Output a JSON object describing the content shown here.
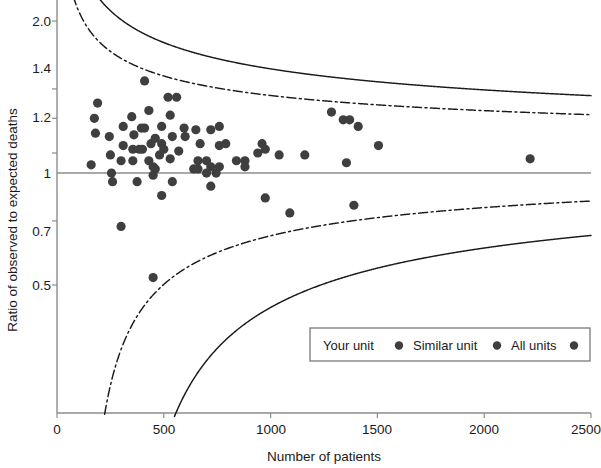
{
  "chart_data": {
    "type": "scatter",
    "title": "",
    "subtitle": "",
    "xlabel": "Number of patients",
    "ylabel": "Ratio of observed to expected deaths",
    "xlim": [
      0,
      2500
    ],
    "ylim": [
      0.42,
      2.05
    ],
    "yscale": "log",
    "grid": false,
    "xticks": [
      0,
      500,
      1000,
      1500,
      2000,
      2500
    ],
    "xticklabels": [
      "0",
      "500",
      "1000",
      "1500",
      "2000",
      "2500"
    ],
    "yticks": [
      2.0,
      1.4,
      1.2,
      1.0,
      0.7,
      0.5
    ],
    "yticklabels": [
      "2.0",
      "1.4",
      "1.2",
      "1",
      "0.7",
      "0.5"
    ],
    "reference_line": {
      "label": "null ratio",
      "y": 1.0,
      "style": "solid",
      "color": "#808080"
    },
    "control_limits": [
      {
        "name": "99.8% limits",
        "style": "solid",
        "color": "#1a1a1a",
        "target": 1.0,
        "z": 3.09,
        "baseline_rate": 0.03
      },
      {
        "name": "95% limits",
        "style": "dash-dot",
        "color": "#1a1a1a",
        "target": 1.0,
        "z": 1.96,
        "baseline_rate": 0.03
      }
    ],
    "legend": {
      "position": "bottom-right",
      "entries": [
        {
          "label": "Your unit",
          "marker": "circle",
          "color": "#3a3a3a"
        },
        {
          "label": "Similar unit",
          "marker": "circle",
          "color": "#3a3a3a"
        },
        {
          "label": "All units",
          "marker": "circle",
          "color": "#3a3a3a"
        }
      ]
    },
    "series": [
      {
        "name": "All units",
        "marker": "circle",
        "color": "#3f3f3f",
        "points": [
          {
            "x": 410,
            "y": 1.46
          },
          {
            "x": 190,
            "y": 1.3
          },
          {
            "x": 520,
            "y": 1.34
          },
          {
            "x": 560,
            "y": 1.34
          },
          {
            "x": 175,
            "y": 1.2
          },
          {
            "x": 430,
            "y": 1.25
          },
          {
            "x": 530,
            "y": 1.22
          },
          {
            "x": 180,
            "y": 1.11
          },
          {
            "x": 350,
            "y": 1.21
          },
          {
            "x": 490,
            "y": 1.15
          },
          {
            "x": 760,
            "y": 1.15
          },
          {
            "x": 310,
            "y": 1.15
          },
          {
            "x": 395,
            "y": 1.14
          },
          {
            "x": 410,
            "y": 1.14
          },
          {
            "x": 595,
            "y": 1.14
          },
          {
            "x": 650,
            "y": 1.13
          },
          {
            "x": 720,
            "y": 1.13
          },
          {
            "x": 245,
            "y": 1.09
          },
          {
            "x": 360,
            "y": 1.1
          },
          {
            "x": 460,
            "y": 1.08
          },
          {
            "x": 540,
            "y": 1.09
          },
          {
            "x": 600,
            "y": 1.09
          },
          {
            "x": 310,
            "y": 1.04
          },
          {
            "x": 440,
            "y": 1.05
          },
          {
            "x": 490,
            "y": 1.05
          },
          {
            "x": 670,
            "y": 1.05
          },
          {
            "x": 760,
            "y": 1.04
          },
          {
            "x": 790,
            "y": 1.05
          },
          {
            "x": 960,
            "y": 1.05
          },
          {
            "x": 975,
            "y": 1.02
          },
          {
            "x": 355,
            "y": 1.02
          },
          {
            "x": 385,
            "y": 1.02
          },
          {
            "x": 400,
            "y": 1.02
          },
          {
            "x": 500,
            "y": 1.02
          },
          {
            "x": 570,
            "y": 1.01
          },
          {
            "x": 250,
            "y": 0.99
          },
          {
            "x": 480,
            "y": 0.99
          },
          {
            "x": 1285,
            "y": 1.24
          },
          {
            "x": 1340,
            "y": 1.19
          },
          {
            "x": 1370,
            "y": 1.19
          },
          {
            "x": 1410,
            "y": 1.15
          },
          {
            "x": 1505,
            "y": 1.04
          },
          {
            "x": 940,
            "y": 1.0
          },
          {
            "x": 1040,
            "y": 0.99
          },
          {
            "x": 1160,
            "y": 0.99
          },
          {
            "x": 2215,
            "y": 0.97
          },
          {
            "x": 1355,
            "y": 0.95
          },
          {
            "x": 1390,
            "y": 0.76
          },
          {
            "x": 1090,
            "y": 0.73
          },
          {
            "x": 300,
            "y": 0.96
          },
          {
            "x": 355,
            "y": 0.96
          },
          {
            "x": 430,
            "y": 0.96
          },
          {
            "x": 530,
            "y": 0.97
          },
          {
            "x": 660,
            "y": 0.96
          },
          {
            "x": 700,
            "y": 0.96
          },
          {
            "x": 840,
            "y": 0.96
          },
          {
            "x": 880,
            "y": 0.96
          },
          {
            "x": 160,
            "y": 0.94
          },
          {
            "x": 450,
            "y": 0.93
          },
          {
            "x": 460,
            "y": 0.92
          },
          {
            "x": 640,
            "y": 0.92
          },
          {
            "x": 660,
            "y": 0.92
          },
          {
            "x": 720,
            "y": 0.93
          },
          {
            "x": 760,
            "y": 0.93
          },
          {
            "x": 880,
            "y": 0.93
          },
          {
            "x": 255,
            "y": 0.9
          },
          {
            "x": 450,
            "y": 0.89
          },
          {
            "x": 700,
            "y": 0.9
          },
          {
            "x": 745,
            "y": 0.9
          },
          {
            "x": 260,
            "y": 0.86
          },
          {
            "x": 375,
            "y": 0.86
          },
          {
            "x": 540,
            "y": 0.86
          },
          {
            "x": 720,
            "y": 0.84
          },
          {
            "x": 490,
            "y": 0.8
          },
          {
            "x": 975,
            "y": 0.79
          },
          {
            "x": 300,
            "y": 0.68
          },
          {
            "x": 450,
            "y": 0.52
          }
        ]
      }
    ]
  },
  "legend": {
    "your_unit": "Your unit",
    "similar_unit": "Similar unit",
    "all_units": "All units"
  },
  "axes": {
    "x_title": "Number of patients",
    "y_title": "Ratio of observed to expected deaths",
    "x_tick_0": "0",
    "x_tick_1": "500",
    "x_tick_2": "1000",
    "x_tick_3": "1500",
    "x_tick_4": "2000",
    "x_tick_5": "2500",
    "y_tick_0": "2.0",
    "y_tick_1": "1.4",
    "y_tick_2": "1.2",
    "y_tick_3": "1",
    "y_tick_4": "0.7",
    "y_tick_5": "0.5"
  },
  "colors": {
    "marker": "#3f3f3f",
    "limit_line": "#1a1a1a",
    "reference_line": "#8c8c8c",
    "frame": "#8c8c8c",
    "text": "#1a1a1a",
    "background": "#ffffff"
  }
}
